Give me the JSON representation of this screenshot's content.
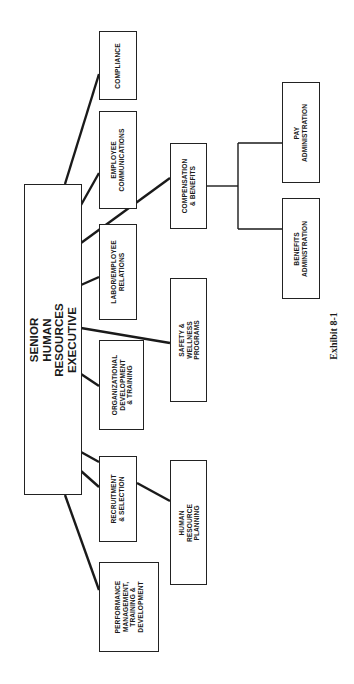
{
  "chart": {
    "title": "Exhibit 8-1",
    "root": {
      "id": "senior",
      "label": "SENIOR\nHUMAN RESOURCES\nEXECUTIVE"
    },
    "direct_reports": [
      {
        "id": "compliance",
        "label": "COMPLIANCE"
      },
      {
        "id": "employee_comm",
        "label": "EMPLOYEE\nCOMMUNICATIONS"
      },
      {
        "id": "comp_benefits",
        "label": "COMPENSATION\n& BENEFITS"
      },
      {
        "id": "labor",
        "label": "LABOR/EMPLOYEE\nRELATIONS"
      },
      {
        "id": "safety",
        "label": "SAFETY &\nWELLNESS PROGRAMS"
      },
      {
        "id": "org_dev",
        "label": "ORGANIZATIONAL\nDEVELOPMENT\n& TRAINING"
      },
      {
        "id": "recruitment",
        "label": "RECRUITMENT\n& SELECTION"
      },
      {
        "id": "performance",
        "label": "PERFORMANCE\nMANAGEMENT,\nTRAINING &\nDEVELOPMENT"
      }
    ],
    "sub_units": [
      {
        "id": "pay_admin",
        "parent": "comp_benefits",
        "label": "PAY\nADMINISTRATION"
      },
      {
        "id": "benefits_admin",
        "parent": "comp_benefits",
        "label": "BENEFITS\nADMINSTRATION"
      },
      {
        "id": "hr_planning",
        "parent": "recruitment",
        "label": "HUMAN RESOURCE\nPLANNING"
      }
    ],
    "orientation": "rotated -90deg (landscape page shown in portrait)",
    "colors": {
      "line": "#1a1a1a",
      "box_border": "#222222",
      "background": "#ffffff"
    }
  },
  "labels": {
    "senior": "SENIOR\nHUMAN RESOURCES\nEXECUTIVE",
    "compliance": "COMPLIANCE",
    "employee_comm": "EMPLOYEE\nCOMMUNICATIONS",
    "comp_benefits": "COMPENSATION\n& BENEFITS",
    "labor": "LABOR/EMPLOYEE\nRELATIONS",
    "safety": "SAFETY &\nWELLNESS PROGRAMS",
    "org_dev": "ORGANIZATIONAL\nDEVELOPMENT\n& TRAINING",
    "recruitment": "RECRUITMENT\n& SELECTION",
    "performance": "PERFORMANCE\nMANAGEMENT,\nTRAINING &\nDEVELOPMENT",
    "pay_admin": "PAY\nADMINISTRATION",
    "benefits_admin": "BENEFITS\nADMINSTRATION",
    "hr_planning": "HUMAN RESOURCE\nPLANNING",
    "caption": "Exhibit 8-1"
  }
}
